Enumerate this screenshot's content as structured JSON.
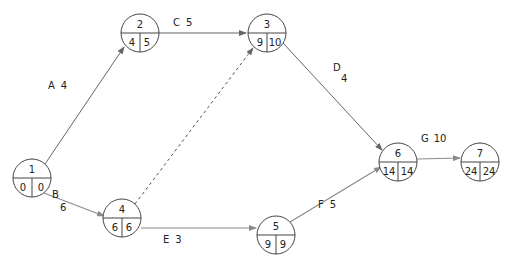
{
  "diagram": {
    "type": "activity-on-arrow network",
    "nodes": [
      {
        "id": "1",
        "es": "0",
        "ls": "0",
        "x": 32,
        "y": 178
      },
      {
        "id": "2",
        "es": "4",
        "ls": "5",
        "x": 140,
        "y": 33
      },
      {
        "id": "3",
        "es": "9",
        "ls": "10",
        "x": 267,
        "y": 33
      },
      {
        "id": "4",
        "es": "6",
        "ls": "6",
        "x": 122,
        "y": 218
      },
      {
        "id": "5",
        "es": "9",
        "ls": "9",
        "x": 276,
        "y": 235
      },
      {
        "id": "6",
        "es": "14",
        "ls": "14",
        "x": 398,
        "y": 162
      },
      {
        "id": "7",
        "es": "24",
        "ls": "24",
        "x": 480,
        "y": 162
      }
    ],
    "edges": [
      {
        "from": "1",
        "to": "2",
        "activity": "A",
        "duration": "4",
        "style": "solid"
      },
      {
        "from": "1",
        "to": "4",
        "activity": "B",
        "duration": "6",
        "style": "light"
      },
      {
        "from": "2",
        "to": "3",
        "activity": "C",
        "duration": "5",
        "style": "solid"
      },
      {
        "from": "3",
        "to": "6",
        "activity": "D",
        "duration": "4",
        "style": "solid"
      },
      {
        "from": "4",
        "to": "5",
        "activity": "E",
        "duration": "3",
        "style": "light"
      },
      {
        "from": "5",
        "to": "6",
        "activity": "F",
        "duration": "5",
        "style": "light"
      },
      {
        "from": "6",
        "to": "7",
        "activity": "G",
        "duration": "10",
        "style": "light"
      },
      {
        "from": "4",
        "to": "3",
        "activity": "",
        "duration": "",
        "style": "dashed"
      }
    ],
    "labels": {
      "A": {
        "activity": "A",
        "duration": "4"
      },
      "B": {
        "activity": "B",
        "duration": "6"
      },
      "C": {
        "activity": "C",
        "duration": "5"
      },
      "D": {
        "activity": "D",
        "duration": "4"
      },
      "E": {
        "activity": "E",
        "duration": "3"
      },
      "F": {
        "activity": "F",
        "duration": "5"
      },
      "G": {
        "activity": "G",
        "duration": "10"
      }
    }
  }
}
